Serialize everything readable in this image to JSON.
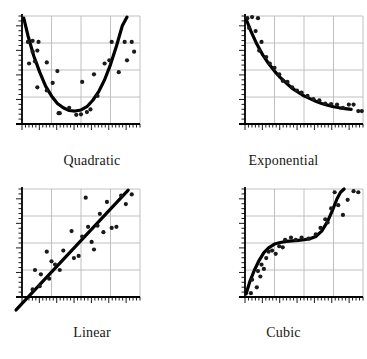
{
  "figure": {
    "title": "",
    "layout": "2x2 grid of scatter plots with fitted trend curves",
    "panel_order": [
      "quadratic",
      "exponential",
      "linear",
      "cubic"
    ]
  },
  "labels": {
    "quadratic": "Quadratic",
    "exponential": "Exponential",
    "linear": "Linear",
    "cubic": "Cubic"
  },
  "style": {
    "curve_color": "#000000",
    "point_color": "#1a1a1a",
    "grid_color": "#b9b9b9",
    "axis_color": "#000000",
    "background": "#ffffff",
    "curve_width": 3.2,
    "point_radius": 2.1
  },
  "chart_data": [
    {
      "type": "scatter",
      "title": "Quadratic",
      "xlabel": "",
      "ylabel": "",
      "xlim": [
        0,
        10
      ],
      "ylim": [
        0,
        10
      ],
      "grid": true,
      "grid_x": [
        2.5,
        5,
        7.5
      ],
      "grid_y": [
        2.5,
        5,
        7.5
      ],
      "legend": "none",
      "fit": {
        "name": "quadratic fit",
        "equation": "y = 0.46x^2 - 4.6x + 13.2",
        "x": [
          0.15,
          0.5,
          1.0,
          1.5,
          2.0,
          2.5,
          3.0,
          3.5,
          4.0,
          4.5,
          5.0,
          5.5,
          6.0,
          6.5,
          7.0,
          7.5,
          8.0,
          8.5,
          8.9
        ],
        "y": [
          9.8,
          8.2,
          6.3,
          4.8,
          3.5,
          2.6,
          1.9,
          1.5,
          1.25,
          1.2,
          1.3,
          1.6,
          2.2,
          3.0,
          4.1,
          5.5,
          7.2,
          9.1,
          9.9
        ]
      },
      "points": {
        "x": [
          0.5,
          0.9,
          1.4,
          0.9,
          1.3,
          0.6,
          1.1,
          2.1,
          3.0,
          1.3,
          2.1,
          2.6,
          3.1,
          3.2,
          4.0,
          4.6,
          5.0,
          5.5,
          5.1,
          5.8,
          6.1,
          6.4,
          7.0,
          7.4,
          7.6,
          8.2,
          8.7,
          8.9,
          9.3,
          9.5
        ],
        "y": [
          7.6,
          7.7,
          7.6,
          6.7,
          6.8,
          5.6,
          5.8,
          5.7,
          4.9,
          3.4,
          3.1,
          3.8,
          1.0,
          1.0,
          1.5,
          0.85,
          0.9,
          1.1,
          3.9,
          1.35,
          4.6,
          2.6,
          5.6,
          5.9,
          7.6,
          4.8,
          7.6,
          5.9,
          7.6,
          6.7
        ]
      }
    },
    {
      "type": "scatter",
      "title": "Exponential",
      "xlabel": "",
      "ylabel": "",
      "xlim": [
        0,
        10
      ],
      "ylim": [
        0,
        10
      ],
      "grid": true,
      "grid_x": [
        2.5,
        5,
        7.5
      ],
      "grid_y": [
        2.5,
        5,
        7.5
      ],
      "legend": "none",
      "fit": {
        "name": "exponential decay fit",
        "equation": "y = 9.6 * e^(-0.30x) + 0.35",
        "x": [
          0.1,
          0.5,
          1.0,
          1.5,
          2.0,
          2.5,
          3.0,
          3.5,
          4.0,
          4.5,
          5.0,
          5.5,
          6.0,
          6.5,
          7.0,
          7.5,
          8.0,
          8.5,
          9.0
        ],
        "y": [
          9.7,
          8.6,
          7.4,
          6.4,
          5.6,
          4.9,
          4.3,
          3.8,
          3.3,
          2.95,
          2.6,
          2.35,
          2.1,
          1.9,
          1.75,
          1.6,
          1.5,
          1.42,
          1.35
        ]
      },
      "points": {
        "x": [
          0.2,
          0.6,
          1.1,
          0.35,
          0.9,
          1.4,
          1.2,
          1.8,
          2.1,
          2.5,
          2.9,
          3.2,
          3.6,
          4.0,
          4.4,
          4.8,
          5.3,
          5.8,
          6.3,
          6.8,
          7.3,
          7.8,
          8.3,
          8.8,
          9.2,
          9.6,
          9.9
        ],
        "y": [
          9.8,
          9.9,
          9.8,
          8.9,
          8.6,
          7.6,
          6.8,
          6.2,
          5.6,
          5.2,
          4.6,
          4.0,
          3.9,
          3.4,
          3.1,
          2.9,
          2.6,
          2.3,
          2.2,
          1.9,
          1.85,
          1.8,
          1.5,
          1.8,
          1.8,
          1.2,
          1.2
        ]
      }
    },
    {
      "type": "scatter",
      "title": "Linear",
      "xlabel": "",
      "ylabel": "",
      "xlim": [
        0,
        10
      ],
      "ylim": [
        0,
        10
      ],
      "grid": true,
      "grid_x": [
        2.5,
        5,
        7.5
      ],
      "grid_y": [
        2.5,
        5,
        7.5
      ],
      "legend": "none",
      "fit": {
        "name": "linear fit",
        "equation": "y = 1.12x - 0.7",
        "x": [
          -0.5,
          9.0
        ],
        "y": [
          -1.2,
          9.9
        ]
      },
      "points": {
        "x": [
          0.9,
          1.1,
          1.5,
          1.6,
          2.1,
          2.3,
          2.5,
          2.8,
          3.2,
          3.5,
          4.2,
          4.4,
          4.8,
          5.1,
          5.4,
          5.6,
          5.9,
          6.1,
          6.4,
          6.6,
          6.9,
          7.2,
          7.6,
          8.0,
          8.4,
          8.8,
          9.3
        ],
        "y": [
          0.7,
          2.5,
          1.0,
          2.1,
          4.2,
          1.7,
          3.3,
          3.0,
          2.5,
          4.3,
          6.1,
          3.6,
          3.8,
          5.6,
          9.2,
          6.5,
          5.1,
          4.4,
          6.6,
          7.7,
          6.0,
          8.8,
          6.4,
          6.5,
          9.4,
          8.6,
          9.5
        ]
      }
    },
    {
      "type": "scatter",
      "title": "Cubic",
      "xlabel": "",
      "ylabel": "",
      "xlim": [
        0,
        10
      ],
      "ylim": [
        0,
        10
      ],
      "grid": true,
      "grid_x": [
        2.5,
        5,
        7.5
      ],
      "grid_y": [
        2.5,
        5,
        7.5
      ],
      "legend": "none",
      "fit": {
        "name": "cubic fit",
        "equation": "y = 0.034(x-5)^3 + 5",
        "x": [
          0.1,
          0.4,
          0.8,
          1.2,
          1.6,
          2.0,
          2.5,
          3.0,
          3.5,
          4.0,
          4.5,
          5.0,
          5.5,
          6.0,
          6.5,
          7.0,
          7.4,
          7.8,
          8.1,
          8.4
        ],
        "y": [
          0.3,
          1.4,
          2.5,
          3.4,
          4.1,
          4.55,
          4.9,
          5.05,
          5.15,
          5.2,
          5.25,
          5.3,
          5.4,
          5.6,
          6.1,
          7.0,
          8.0,
          9.1,
          9.7,
          10.0
        ]
      },
      "points": {
        "x": [
          0.5,
          0.6,
          1.0,
          1.1,
          1.3,
          1.4,
          1.6,
          1.8,
          2.0,
          2.3,
          2.6,
          2.9,
          3.2,
          3.4,
          3.9,
          4.3,
          4.8,
          5.4,
          6.0,
          6.4,
          6.8,
          7.0,
          7.3,
          7.6,
          7.9,
          8.3,
          8.7,
          9.2,
          9.6
        ],
        "y": [
          0.35,
          1.6,
          0.9,
          2.4,
          1.9,
          3.0,
          2.6,
          3.6,
          4.2,
          4.3,
          4.0,
          4.7,
          4.6,
          5.3,
          5.5,
          5.3,
          5.5,
          5.4,
          5.8,
          6.4,
          7.2,
          6.9,
          8.2,
          9.7,
          8.5,
          7.6,
          9.0,
          9.8,
          9.7
        ]
      }
    }
  ]
}
